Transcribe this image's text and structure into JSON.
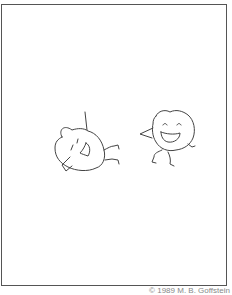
{
  "illustration": {
    "description": "Two round-headed laughing figures drawn in simple line art",
    "stroke_color": "#444444",
    "frame_color": "#555555"
  },
  "credit": "© 1989 M. B. Goffstein"
}
